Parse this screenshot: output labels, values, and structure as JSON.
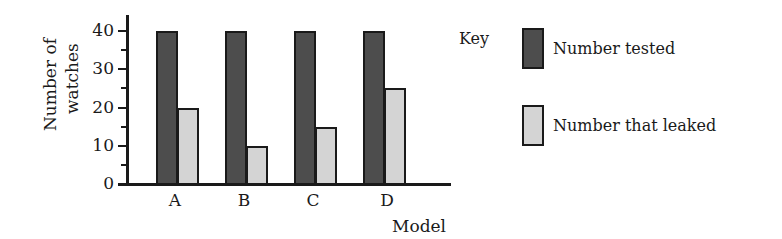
{
  "chart_data": {
    "type": "bar",
    "title": "",
    "xlabel": "Model",
    "ylabel": "Number of watches",
    "ylabel_lines": [
      "Number of",
      "watches"
    ],
    "categories": [
      "A",
      "B",
      "C",
      "D"
    ],
    "series": [
      {
        "name": "Number tested",
        "color": "#4d4d4d",
        "values": [
          40,
          40,
          40,
          40
        ]
      },
      {
        "name": "Number that leaked",
        "color": "#d4d4d4",
        "values": [
          20,
          10,
          15,
          25
        ]
      }
    ],
    "ylim": [
      0,
      40
    ],
    "yticks": [
      0,
      10,
      20,
      30,
      40
    ],
    "ytick_labels": [
      "0",
      "10",
      "20",
      "30",
      "40"
    ],
    "minor_ticks_every": 5,
    "grid": false,
    "legend": {
      "title": "Key",
      "position": "right",
      "entries": [
        "Number tested",
        "Number that leaked"
      ]
    }
  }
}
